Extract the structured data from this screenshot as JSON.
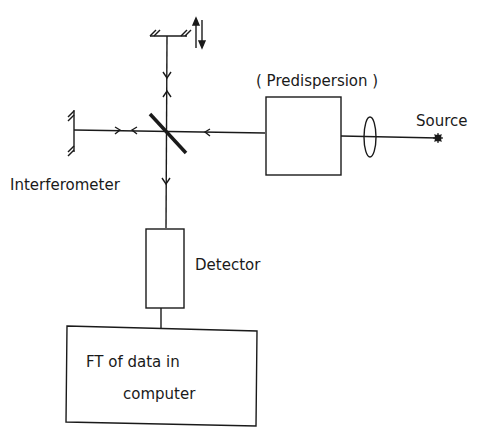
{
  "diagram": {
    "labels": {
      "predispersion": "( Predispersion )",
      "source": "Source",
      "interferometer": "Interferometer",
      "detector": "Detector",
      "computer_line1": "FT of data in",
      "computer_line2": "computer"
    },
    "components": [
      {
        "id": "source",
        "shape": "star-dot"
      },
      {
        "id": "lens",
        "shape": "ellipse"
      },
      {
        "id": "predispersion",
        "shape": "box"
      },
      {
        "id": "beamsplitter",
        "shape": "diagonal-line"
      },
      {
        "id": "fixed-mirror",
        "shape": "hatched-vertical-line"
      },
      {
        "id": "moving-mirror",
        "shape": "hatched-horizontal-line",
        "motion": "up-down-arrows"
      },
      {
        "id": "detector",
        "shape": "box"
      },
      {
        "id": "computer",
        "shape": "box"
      }
    ],
    "colors": {
      "line": "#1a1a1a",
      "background": "#ffffff"
    }
  }
}
